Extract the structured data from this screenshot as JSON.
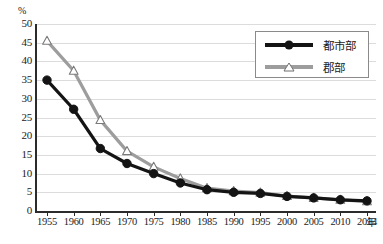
{
  "chart_data": {
    "type": "line",
    "title": "",
    "subtitle": "",
    "xlabel": "年",
    "ylabel": "%",
    "x": [
      1955,
      1960,
      1965,
      1970,
      1975,
      1980,
      1985,
      1990,
      1995,
      2000,
      2005,
      2010,
      2014
    ],
    "categories": [
      "1955",
      "1960",
      "1965",
      "1970",
      "1975",
      "1980",
      "1985",
      "1990",
      "1995",
      "2000",
      "2005",
      "2010",
      "2014"
    ],
    "series": [
      {
        "name": "都市部",
        "color": "#141414",
        "marker": "filled-circle",
        "values": [
          35.0,
          27.2,
          16.7,
          12.7,
          10.0,
          7.5,
          5.7,
          5.0,
          4.7,
          3.9,
          3.5,
          3.0,
          2.7
        ]
      },
      {
        "name": "郡部",
        "color": "#9d9d9d",
        "marker": "open-triangle",
        "values": [
          45.5,
          37.5,
          24.3,
          16.0,
          11.8,
          8.7,
          6.1,
          5.3,
          4.9,
          4.0,
          3.5,
          3.0,
          2.6
        ]
      }
    ],
    "ylim": [
      0,
      50
    ],
    "ytick_step": 5,
    "yticks": [
      "50",
      "45",
      "40",
      "35",
      "30",
      "25",
      "20",
      "15",
      "10",
      "5",
      "0"
    ],
    "grid": true,
    "grid_axis": "y",
    "legend_position": "top-right",
    "legend_entries": [
      "都市部",
      "郡部"
    ]
  },
  "axis": {
    "y_unit": "%",
    "x_unit": "年"
  },
  "legend": {
    "items": [
      {
        "label": "都市部",
        "color": "#141414",
        "marker": "filled-circle"
      },
      {
        "label": "郡部",
        "color": "#9d9d9d",
        "marker": "open-triangle"
      }
    ]
  },
  "colors": {
    "urban": "#141414",
    "rural": "#9d9d9d",
    "grid": "#dcdcdc",
    "axis": "#2b2b2b",
    "background": "#ffffff"
  }
}
